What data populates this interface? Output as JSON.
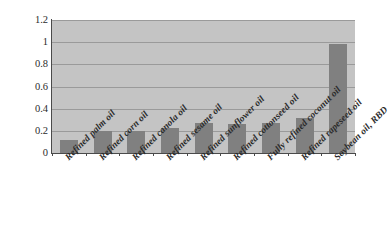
{
  "chart_data": {
    "type": "bar",
    "title": "",
    "subtitle": "",
    "xlabel": "",
    "ylabel": "",
    "categories": [
      "Refined palm oil",
      "Refined corn oil",
      "Refined canola oil",
      "Refined sesame oil",
      "Refined sunflower oil",
      "Refined cottonseed oil",
      "Fully refined coconut oil",
      "Refined rapeseed oil",
      "Soybean oil, RBD"
    ],
    "values": [
      0.12,
      0.2,
      0.2,
      0.23,
      0.27,
      0.265,
      0.27,
      0.32,
      0.98
    ],
    "ylim": [
      0,
      1.2
    ],
    "ytick_labels": [
      "0",
      "0.2",
      "0.4",
      "0.6",
      "0.8",
      "1",
      "1.2"
    ],
    "ytick_values": [
      0,
      0.2,
      0.4,
      0.6,
      0.8,
      1.0,
      1.2
    ],
    "grid": true,
    "legend": false,
    "legend_position": "none",
    "colors": {
      "bar_fill": "#808080",
      "plot_background": "#c4c4c4",
      "gridline": "#9a9a9a",
      "axis": "#4a4a4a",
      "text": "#2b2b2b",
      "page_background": "#ffffff"
    }
  }
}
